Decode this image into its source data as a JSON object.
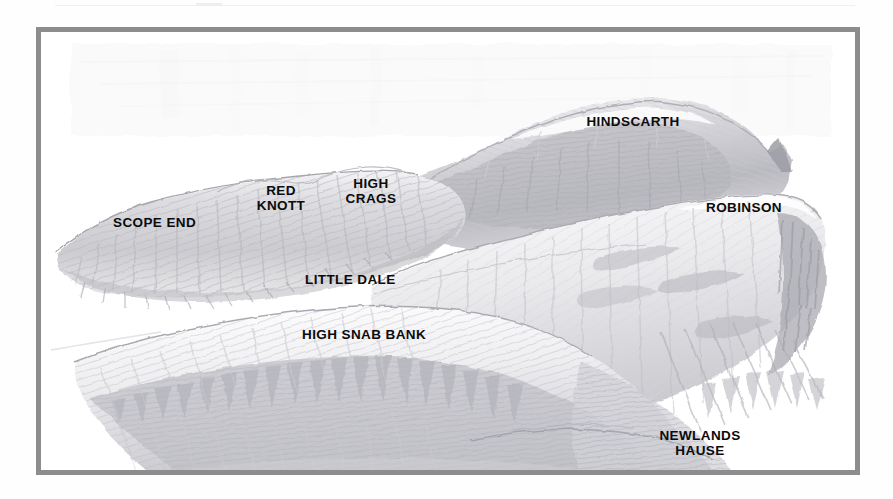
{
  "page": {
    "background_color": "#ffffff",
    "width": 893,
    "height": 499
  },
  "frame": {
    "border_color": "#8d8d8d",
    "border_width": 5,
    "fill_color": "#ffffff"
  },
  "illustration": {
    "kind": "pencil-sketch-panorama",
    "subject": "Newlands Valley ridge panorama, English Lake District",
    "medium_note": "graphite / pencil shading on white paper, scanned",
    "ink_color": "#9a9a9f",
    "shade_light": "#e4e4e6",
    "shade_mid": "#c6c6ca",
    "shade_dark": "#a3a3a9"
  },
  "labels": [
    {
      "id": "scope-end",
      "text": "SCOPE END",
      "x": 72,
      "y": 183,
      "align": "left"
    },
    {
      "id": "red-knott",
      "text": "RED\nKNOTT",
      "x": 240,
      "y": 151,
      "align": "center"
    },
    {
      "id": "high-crags",
      "text": "HIGH\nCRAGS",
      "x": 330,
      "y": 144,
      "align": "center"
    },
    {
      "id": "hindscarth",
      "text": "HINDSCARTH",
      "x": 592,
      "y": 82,
      "align": "center"
    },
    {
      "id": "robinson",
      "text": "ROBINSON",
      "x": 703,
      "y": 168,
      "align": "center"
    },
    {
      "id": "little-dale",
      "text": "LITTLE DALE",
      "x": 264,
      "y": 240,
      "align": "left"
    },
    {
      "id": "high-snab-bank",
      "text": "HIGH SNAB BANK",
      "x": 261,
      "y": 295,
      "align": "left"
    },
    {
      "id": "newlands-hause",
      "text": "NEWLANDS\nHAUSE",
      "x": 659,
      "y": 396,
      "align": "center"
    }
  ]
}
